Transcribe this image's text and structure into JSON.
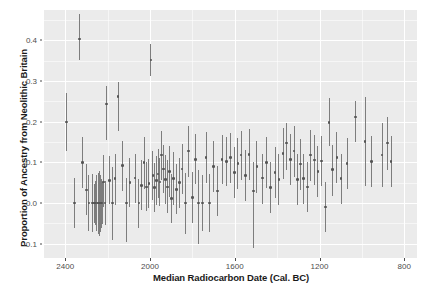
{
  "chart_data": {
    "type": "scatter",
    "title": "",
    "xlabel": "Median Radiocarbon Date (Cal. BC)",
    "ylabel": "Proportion of Ancestry from Neolithic Britain",
    "xlim": [
      2500,
      740
    ],
    "ylim": [
      -0.135,
      0.475
    ],
    "x_reversed": true,
    "grid": true,
    "legend": "none",
    "xticks": [
      2400,
      2000,
      1600,
      1200,
      800
    ],
    "xtick_labels": [
      "2400",
      "2000",
      "1600",
      "1200",
      "800"
    ],
    "yticks": [
      0.4,
      0.3,
      0.2,
      0.1,
      0.0,
      -0.1
    ],
    "ytick_labels": [
      "0.4",
      "0.3",
      "0.2",
      "0.1",
      "0.0",
      "-0.1"
    ],
    "point_color": "#555555",
    "errorbar_color": "#7d7d7d",
    "panel_color": "#ebebeb",
    "grid_color": "#ffffff",
    "series_name": "Neolithic ancestry proportion",
    "n_points": 96,
    "points": [
      {
        "x": 2395,
        "y": 0.2,
        "lo": 0.128,
        "hi": 0.272
      },
      {
        "x": 2355,
        "y": 0.0,
        "lo": -0.062,
        "hi": 0.062
      },
      {
        "x": 2333,
        "y": 0.404,
        "lo": 0.352,
        "hi": 0.466
      },
      {
        "x": 2318,
        "y": 0.1,
        "lo": 0.038,
        "hi": 0.162
      },
      {
        "x": 2300,
        "y": 0.032,
        "lo": -0.03,
        "hi": 0.097
      },
      {
        "x": 2288,
        "y": 0.0,
        "lo": -0.068,
        "hi": 0.068
      },
      {
        "x": 2272,
        "y": 0.0,
        "lo": -0.072,
        "hi": 0.072
      },
      {
        "x": 2262,
        "y": 0.0,
        "lo": -0.048,
        "hi": 0.048
      },
      {
        "x": 2256,
        "y": 0.0,
        "lo": -0.055,
        "hi": 0.055
      },
      {
        "x": 2250,
        "y": 0.0,
        "lo": -0.068,
        "hi": 0.068
      },
      {
        "x": 2245,
        "y": 0.0,
        "lo": -0.075,
        "hi": 0.075
      },
      {
        "x": 2240,
        "y": 0.0,
        "lo": -0.08,
        "hi": 0.08
      },
      {
        "x": 2235,
        "y": 0.0,
        "lo": -0.07,
        "hi": 0.07
      },
      {
        "x": 2230,
        "y": 0.0,
        "lo": -0.06,
        "hi": 0.06
      },
      {
        "x": 2226,
        "y": 0.0,
        "lo": -0.052,
        "hi": 0.052
      },
      {
        "x": 2220,
        "y": 0.052,
        "lo": -0.01,
        "hi": 0.118
      },
      {
        "x": 2212,
        "y": 0.0,
        "lo": -0.055,
        "hi": 0.055
      },
      {
        "x": 2205,
        "y": 0.244,
        "lo": 0.155,
        "hi": 0.288
      },
      {
        "x": 2190,
        "y": 0.056,
        "lo": -0.002,
        "hi": 0.115
      },
      {
        "x": 2178,
        "y": 0.0,
        "lo": -0.09,
        "hi": 0.09
      },
      {
        "x": 2165,
        "y": 0.06,
        "lo": -0.005,
        "hi": 0.122
      },
      {
        "x": 2150,
        "y": 0.262,
        "lo": 0.178,
        "hi": 0.298
      },
      {
        "x": 2130,
        "y": 0.092,
        "lo": 0.03,
        "hi": 0.152
      },
      {
        "x": 2110,
        "y": 0.0,
        "lo": -0.095,
        "hi": 0.062
      },
      {
        "x": 2095,
        "y": 0.05,
        "lo": -0.01,
        "hi": 0.112
      },
      {
        "x": 2070,
        "y": 0.062,
        "lo": 0.0,
        "hi": 0.122
      },
      {
        "x": 2052,
        "y": 0.0,
        "lo": -0.06,
        "hi": 0.06
      },
      {
        "x": 2040,
        "y": 0.044,
        "lo": -0.018,
        "hi": 0.105
      },
      {
        "x": 2028,
        "y": 0.1,
        "lo": 0.035,
        "hi": 0.162
      },
      {
        "x": 2016,
        "y": 0.04,
        "lo": -0.02,
        "hi": 0.1
      },
      {
        "x": 2005,
        "y": 0.048,
        "lo": -0.012,
        "hi": 0.108
      },
      {
        "x": 1996,
        "y": 0.352,
        "lo": 0.312,
        "hi": 0.392
      },
      {
        "x": 1986,
        "y": 0.068,
        "lo": 0.008,
        "hi": 0.128
      },
      {
        "x": 1978,
        "y": 0.038,
        "lo": -0.022,
        "hi": 0.098
      },
      {
        "x": 1970,
        "y": 0.056,
        "lo": -0.004,
        "hi": 0.116
      },
      {
        "x": 1962,
        "y": 0.072,
        "lo": 0.012,
        "hi": 0.132
      },
      {
        "x": 1953,
        "y": 0.052,
        "lo": -0.008,
        "hi": 0.112
      },
      {
        "x": 1945,
        "y": 0.118,
        "lo": 0.058,
        "hi": 0.178
      },
      {
        "x": 1936,
        "y": 0.084,
        "lo": 0.024,
        "hi": 0.144
      },
      {
        "x": 1928,
        "y": 0.058,
        "lo": -0.002,
        "hi": 0.118
      },
      {
        "x": 1918,
        "y": 0.04,
        "lo": -0.025,
        "hi": 0.105
      },
      {
        "x": 1908,
        "y": 0.078,
        "lo": 0.015,
        "hi": 0.14
      },
      {
        "x": 1898,
        "y": 0.012,
        "lo": -0.048,
        "hi": 0.072
      },
      {
        "x": 1888,
        "y": 0.06,
        "lo": -0.005,
        "hi": 0.125
      },
      {
        "x": 1876,
        "y": 0.034,
        "lo": -0.028,
        "hi": 0.096
      },
      {
        "x": 1862,
        "y": 0.05,
        "lo": -0.012,
        "hi": 0.112
      },
      {
        "x": 1848,
        "y": 0.084,
        "lo": 0.022,
        "hi": 0.146
      },
      {
        "x": 1832,
        "y": 0.0,
        "lo": -0.075,
        "hi": 0.075
      },
      {
        "x": 1818,
        "y": 0.128,
        "lo": 0.065,
        "hi": 0.19
      },
      {
        "x": 1800,
        "y": 0.014,
        "lo": -0.048,
        "hi": 0.076
      },
      {
        "x": 1785,
        "y": 0.108,
        "lo": 0.048,
        "hi": 0.17
      },
      {
        "x": 1770,
        "y": 0.0,
        "lo": -0.1,
        "hi": 0.082
      },
      {
        "x": 1752,
        "y": 0.0,
        "lo": -0.068,
        "hi": 0.068
      },
      {
        "x": 1735,
        "y": 0.112,
        "lo": 0.05,
        "hi": 0.175
      },
      {
        "x": 1718,
        "y": 0.0,
        "lo": -0.072,
        "hi": 0.072
      },
      {
        "x": 1700,
        "y": 0.09,
        "lo": 0.028,
        "hi": 0.152
      },
      {
        "x": 1680,
        "y": 0.03,
        "lo": -0.032,
        "hi": 0.092
      },
      {
        "x": 1660,
        "y": 0.108,
        "lo": 0.048,
        "hi": 0.168
      },
      {
        "x": 1640,
        "y": 0.102,
        "lo": 0.042,
        "hi": 0.162
      },
      {
        "x": 1620,
        "y": 0.112,
        "lo": 0.05,
        "hi": 0.172
      },
      {
        "x": 1600,
        "y": 0.075,
        "lo": 0.012,
        "hi": 0.138
      },
      {
        "x": 1585,
        "y": 0.098,
        "lo": 0.035,
        "hi": 0.16
      },
      {
        "x": 1570,
        "y": 0.118,
        "lo": 0.058,
        "hi": 0.178
      },
      {
        "x": 1550,
        "y": 0.068,
        "lo": 0.005,
        "hi": 0.13
      },
      {
        "x": 1532,
        "y": 0.12,
        "lo": 0.058,
        "hi": 0.182
      },
      {
        "x": 1512,
        "y": 0.03,
        "lo": -0.11,
        "hi": 0.1
      },
      {
        "x": 1495,
        "y": 0.09,
        "lo": 0.025,
        "hi": 0.152
      },
      {
        "x": 1470,
        "y": 0.062,
        "lo": -0.002,
        "hi": 0.122
      },
      {
        "x": 1450,
        "y": 0.1,
        "lo": 0.038,
        "hi": 0.162
      },
      {
        "x": 1430,
        "y": 0.038,
        "lo": -0.025,
        "hi": 0.1
      },
      {
        "x": 1410,
        "y": 0.075,
        "lo": 0.012,
        "hi": 0.138
      },
      {
        "x": 1392,
        "y": 0.058,
        "lo": -0.005,
        "hi": 0.12
      },
      {
        "x": 1372,
        "y": 0.122,
        "lo": 0.06,
        "hi": 0.184
      },
      {
        "x": 1355,
        "y": 0.148,
        "lo": 0.082,
        "hi": 0.198
      },
      {
        "x": 1338,
        "y": 0.108,
        "lo": 0.045,
        "hi": 0.17
      },
      {
        "x": 1320,
        "y": 0.128,
        "lo": 0.065,
        "hi": 0.19
      },
      {
        "x": 1305,
        "y": 0.058,
        "lo": -0.005,
        "hi": 0.122
      },
      {
        "x": 1290,
        "y": 0.096,
        "lo": 0.032,
        "hi": 0.158
      },
      {
        "x": 1275,
        "y": 0.06,
        "lo": -0.002,
        "hi": 0.122
      },
      {
        "x": 1258,
        "y": 0.04,
        "lo": -0.022,
        "hi": 0.102
      },
      {
        "x": 1242,
        "y": 0.118,
        "lo": 0.055,
        "hi": 0.18
      },
      {
        "x": 1225,
        "y": 0.106,
        "lo": 0.045,
        "hi": 0.168
      },
      {
        "x": 1208,
        "y": 0.078,
        "lo": 0.015,
        "hi": 0.14
      },
      {
        "x": 1190,
        "y": 0.104,
        "lo": 0.042,
        "hi": 0.166
      },
      {
        "x": 1172,
        "y": -0.01,
        "lo": -0.072,
        "hi": 0.052
      },
      {
        "x": 1155,
        "y": 0.198,
        "lo": 0.14,
        "hi": 0.258
      },
      {
        "x": 1138,
        "y": 0.082,
        "lo": 0.018,
        "hi": 0.144
      },
      {
        "x": 1118,
        "y": 0.112,
        "lo": 0.05,
        "hi": 0.174
      },
      {
        "x": 1098,
        "y": 0.06,
        "lo": -0.002,
        "hi": 0.122
      },
      {
        "x": 1070,
        "y": 0.098,
        "lo": 0.035,
        "hi": 0.16
      },
      {
        "x": 1030,
        "y": 0.212,
        "lo": 0.15,
        "hi": 0.252
      },
      {
        "x": 985,
        "y": 0.152,
        "lo": 0.042,
        "hi": 0.262
      },
      {
        "x": 955,
        "y": 0.102,
        "lo": 0.04,
        "hi": 0.164
      },
      {
        "x": 905,
        "y": 0.118,
        "lo": 0.04,
        "hi": 0.196
      },
      {
        "x": 880,
        "y": 0.148,
        "lo": 0.082,
        "hi": 0.212
      },
      {
        "x": 862,
        "y": 0.102,
        "lo": 0.04,
        "hi": 0.164
      }
    ]
  }
}
